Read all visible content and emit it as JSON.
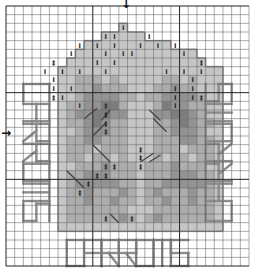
{
  "grid": {
    "cols": 28,
    "rows": 30,
    "major_every": 10
  },
  "center_markers": {
    "top_arrow": "↓",
    "left_arrow": "→"
  },
  "palette": {
    "a": "#dcdcdc",
    "b": "#c6c6c6",
    "c": "#adadad",
    "d": "#939393",
    "e": "#7d7d7d",
    "outline": "#8a8a8a",
    "text_stitch": "#8c8c8c",
    "grid_minor": "#555555",
    "grid_major": "#222222"
  },
  "cells": [
    "............................",
    "............................",
    ".............b..............",
    "...........bbbbb............",
    ".........bbbbbbbbbb.........",
    "........bbbbbbbbbbbbbb......",
    ".......bbbbbbbbbbbbbbbb.....",
    "......bbbbbbbbbbbbbbbbbbb...",
    "......bbcccbcbbbbbccbcbbb...",
    "......bbccdcccbbbccdccbbb...",
    "......bbcddddccbccddddcbb...",
    "......bccddeecbbbceddccbb...",
    "......bcddeeddbbbddeedcbb...",
    "......bccdedccbbbccdedccb...",
    "......bbcdddccbbbccdddcbb...",
    "......bccddcccbbbcccddccb...",
    "......bcccbcccbbbcccbcccb...",
    "......bccbccbcbbbcbccbccb...",
    "......bbcccdcccbcccdcccbb...",
    "......bccdddcccbcccdddccb...",
    "......bcdddddccbccdddddcb...",
    "......bccdcccdcbcdcccdccb...",
    "......bccdccdccbccdccdccb...",
    "......bcccccccbbbcccccccb...",
    "......bccccccdcbcdccccccb...",
    "......bbbbbbbbbbbbbbbbbbb...",
    "............................",
    "............................",
    "............................",
    "............................"
  ],
  "symbols": [
    {
      "r": 2,
      "c": 13,
      "s": "I"
    },
    {
      "r": 3,
      "c": 11,
      "s": "I"
    },
    {
      "r": 3,
      "c": 12,
      "s": "I"
    },
    {
      "r": 3,
      "c": 16,
      "s": "I"
    },
    {
      "r": 4,
      "c": 8,
      "s": "I"
    },
    {
      "r": 4,
      "c": 10,
      "s": "I"
    },
    {
      "r": 4,
      "c": 12,
      "s": "I"
    },
    {
      "r": 4,
      "c": 15,
      "s": "I"
    },
    {
      "r": 4,
      "c": 17,
      "s": "I"
    },
    {
      "r": 4,
      "c": 19,
      "s": "I"
    },
    {
      "r": 5,
      "c": 7,
      "s": "I"
    },
    {
      "r": 5,
      "c": 11,
      "s": "I"
    },
    {
      "r": 5,
      "c": 13,
      "s": "I"
    },
    {
      "r": 5,
      "c": 14,
      "s": "I"
    },
    {
      "r": 5,
      "c": 20,
      "s": "I"
    },
    {
      "r": 6,
      "c": 5,
      "s": "‡"
    },
    {
      "r": 6,
      "c": 10,
      "s": "I"
    },
    {
      "r": 6,
      "c": 12,
      "s": "I"
    },
    {
      "r": 6,
      "c": 22,
      "s": "‡"
    },
    {
      "r": 7,
      "c": 4,
      "s": "I"
    },
    {
      "r": 7,
      "c": 6,
      "s": "I"
    },
    {
      "r": 7,
      "c": 8,
      "s": "I"
    },
    {
      "r": 7,
      "c": 11,
      "s": "I"
    },
    {
      "r": 7,
      "c": 18,
      "s": "I"
    },
    {
      "r": 7,
      "c": 20,
      "s": "I"
    },
    {
      "r": 7,
      "c": 22,
      "s": "I"
    },
    {
      "r": 8,
      "c": 5,
      "s": "I"
    },
    {
      "r": 8,
      "c": 21,
      "s": "I"
    },
    {
      "r": 9,
      "c": 5,
      "s": "I"
    },
    {
      "r": 9,
      "c": 7,
      "s": "I"
    },
    {
      "r": 9,
      "c": 19,
      "s": "I"
    },
    {
      "r": 9,
      "c": 21,
      "s": "I"
    },
    {
      "r": 10,
      "c": 5,
      "s": "‡"
    },
    {
      "r": 10,
      "c": 6,
      "s": "I"
    },
    {
      "r": 10,
      "c": 19,
      "s": "I"
    },
    {
      "r": 10,
      "c": 21,
      "s": "I"
    },
    {
      "r": 10,
      "c": 22,
      "s": "‡"
    },
    {
      "r": 11,
      "c": 8,
      "s": "I"
    },
    {
      "r": 11,
      "c": 11,
      "s": "‡"
    },
    {
      "r": 11,
      "c": 19,
      "s": "I"
    },
    {
      "r": 12,
      "c": 11,
      "s": "‡"
    },
    {
      "r": 13,
      "c": 11,
      "s": "‡"
    },
    {
      "r": 14,
      "c": 11,
      "s": "‡"
    },
    {
      "r": 16,
      "c": 15,
      "s": "‡"
    },
    {
      "r": 17,
      "c": 15,
      "s": "‡"
    },
    {
      "r": 18,
      "c": 11,
      "s": "‡"
    },
    {
      "r": 18,
      "c": 12,
      "s": "‡"
    },
    {
      "r": 18,
      "c": 15,
      "s": "‡"
    },
    {
      "r": 19,
      "c": 10,
      "s": "‡"
    },
    {
      "r": 19,
      "c": 11,
      "s": "‡"
    },
    {
      "r": 20,
      "c": 9,
      "s": "‡"
    },
    {
      "r": 21,
      "c": 8,
      "s": "‡"
    },
    {
      "r": 24,
      "c": 11,
      "s": "‡"
    },
    {
      "r": 24,
      "c": 14,
      "s": "‡"
    }
  ],
  "backstitch": [
    {
      "r1": 13,
      "c1": 9,
      "r2": 11.8,
      "c2": 10.5
    },
    {
      "r1": 13.2,
      "c1": 11,
      "r2": 12,
      "c2": 12
    },
    {
      "r1": 15,
      "c1": 10,
      "r2": 13.5,
      "c2": 11.5
    },
    {
      "r1": 12,
      "c1": 16.5,
      "r2": 13.2,
      "c2": 17.8
    },
    {
      "r1": 13,
      "c1": 17,
      "r2": 14.5,
      "c2": 18.5
    },
    {
      "r1": 16,
      "c1": 10,
      "r2": 17,
      "c2": 11
    },
    {
      "r1": 17,
      "c1": 11,
      "r2": 18,
      "c2": 12
    },
    {
      "r1": 18,
      "c1": 15.5,
      "r2": 17,
      "c2": 17
    },
    {
      "r1": 18,
      "c1": 16.5,
      "r2": 17.2,
      "c2": 17.8
    },
    {
      "r1": 19,
      "c1": 7,
      "r2": 20,
      "c2": 8
    },
    {
      "r1": 20,
      "c1": 8,
      "r2": 21,
      "c2": 9
    },
    {
      "r1": 24,
      "c1": 12,
      "r2": 25,
      "c2": 13
    }
  ],
  "outline_segments": [
    {
      "type": "body",
      "r0": 2,
      "c0": 5,
      "r1": 26,
      "c1": 23
    }
  ],
  "text_labels": {
    "bottom": "CARROMS",
    "left": "CARROMS",
    "right": "CARROMS"
  },
  "text_layout": {
    "bottom": {
      "r": 27,
      "c": 7,
      "dir": "h"
    },
    "left": {
      "r": 9,
      "c": 2,
      "dir": "v-down"
    },
    "right": {
      "r": 9,
      "c": 23,
      "dir": "v-up"
    }
  }
}
